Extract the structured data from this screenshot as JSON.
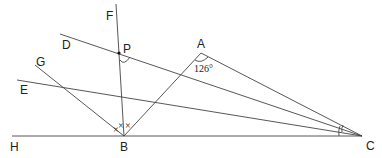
{
  "diagram": {
    "type": "geometry",
    "points": {
      "A": {
        "label": "A",
        "x": 201,
        "y": 53
      },
      "B": {
        "label": "B",
        "x": 124,
        "y": 136
      },
      "C": {
        "label": "C",
        "x": 362,
        "y": 136
      },
      "P": {
        "label": "P",
        "x": 119,
        "y": 53
      },
      "D": {
        "label": "D"
      },
      "E": {
        "label": "E"
      },
      "F": {
        "label": "F"
      },
      "G": {
        "label": "G"
      },
      "H": {
        "label": "H"
      }
    },
    "angle_label": "126°",
    "angle_at": "A",
    "marks": {
      "B_bisector_marks": "×",
      "C_arc_marks": "equal angles"
    }
  }
}
